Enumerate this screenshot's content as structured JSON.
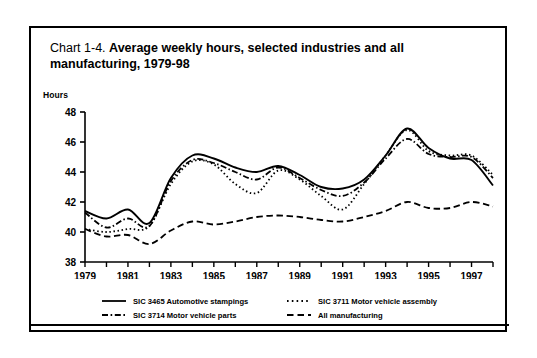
{
  "chart_label": "Chart 1-4.",
  "title_bold": "Average weekly hours, selected industries and all manufacturing, 1979-98",
  "y_axis_title": "Hours",
  "legend": {
    "items": [
      {
        "label": "SIC 3465 Automotive stampings",
        "style": "solid",
        "icon": "solid-line-swatch"
      },
      {
        "label": "SIC 3711 Motor vehicle assembly",
        "style": "dotted",
        "icon": "dotted-line-swatch"
      },
      {
        "label": "SIC 3714 Motor vehicle parts",
        "style": "dashdot",
        "icon": "dashdot-line-swatch"
      },
      {
        "label": "All manufacturing",
        "style": "dashed",
        "icon": "dashed-line-swatch"
      }
    ]
  },
  "chart_data": {
    "type": "line",
    "title": "Chart 1-4. Average weekly hours, selected industries and all manufacturing, 1979-98",
    "xlabel": "",
    "ylabel": "Hours",
    "ylim": [
      38,
      48
    ],
    "xlim": [
      1979,
      1998
    ],
    "grid": false,
    "legend_position": "bottom",
    "ytick_labels": [
      "48",
      "46",
      "44",
      "42",
      "40",
      "38"
    ],
    "yticks": [
      48,
      46,
      44,
      42,
      40,
      38
    ],
    "xtick_labels": [
      "1979",
      "1981",
      "1983",
      "1985",
      "1987",
      "1989",
      "1991",
      "1993",
      "1995",
      "1997"
    ],
    "xticks": [
      1979,
      1981,
      1983,
      1985,
      1987,
      1989,
      1991,
      1993,
      1995,
      1997
    ],
    "x": [
      1979,
      1980,
      1981,
      1982,
      1983,
      1984,
      1985,
      1986,
      1987,
      1988,
      1989,
      1990,
      1991,
      1992,
      1993,
      1994,
      1995,
      1996,
      1997,
      1998
    ],
    "series": [
      {
        "name": "SIC 3465 Automotive stampings",
        "style": "solid",
        "values": [
          41.4,
          40.9,
          41.5,
          40.6,
          43.6,
          45.1,
          44.9,
          44.3,
          44.0,
          44.4,
          43.8,
          43.0,
          42.9,
          43.5,
          45.1,
          46.9,
          45.6,
          44.9,
          44.8,
          43.1
        ]
      },
      {
        "name": "SIC 3711 Motor vehicle assembly",
        "style": "dotted",
        "values": [
          40.2,
          40.0,
          40.2,
          40.4,
          43.2,
          44.7,
          44.5,
          43.2,
          42.6,
          44.1,
          43.5,
          42.4,
          41.5,
          43.2,
          45.1,
          46.8,
          45.4,
          45.1,
          45.1,
          43.8
        ]
      },
      {
        "name": "SIC 3714 Motor vehicle parts",
        "style": "dashdot",
        "values": [
          41.3,
          40.3,
          40.9,
          40.4,
          43.4,
          44.8,
          44.6,
          44.0,
          43.5,
          44.3,
          43.6,
          42.8,
          42.4,
          43.3,
          44.9,
          46.2,
          45.2,
          45.0,
          45.0,
          43.6
        ]
      },
      {
        "name": "All manufacturing",
        "style": "dashed",
        "values": [
          40.2,
          39.7,
          39.8,
          39.2,
          40.1,
          40.7,
          40.5,
          40.7,
          41.0,
          41.1,
          41.0,
          40.8,
          40.7,
          41.0,
          41.4,
          42.0,
          41.6,
          41.6,
          42.0,
          41.7
        ]
      }
    ]
  }
}
